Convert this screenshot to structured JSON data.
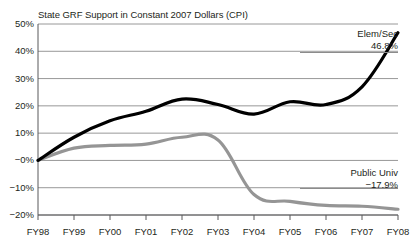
{
  "chart_data": {
    "type": "line",
    "title": "State GRF Support in Constant 2007 Dollars (CPI)",
    "xlabel": "",
    "ylabel": "",
    "grid": true,
    "legend_position": "inline-annotation",
    "x": [
      "FY98",
      "FY99",
      "FY00",
      "FY01",
      "FY02",
      "FY03",
      "FY04",
      "FY05",
      "FY06",
      "FY07",
      "FY08"
    ],
    "ylim": [
      -20,
      50
    ],
    "yticks": [
      -20,
      -10,
      0,
      10,
      20,
      30,
      40,
      50
    ],
    "ytick_labels": [
      "−20%",
      "−10%",
      "−0%",
      "10%",
      "20%",
      "30%",
      "40%",
      "50%"
    ],
    "series": [
      {
        "name": "Elem/Sec",
        "color": "#000000",
        "end_label": "46.8%",
        "end_value": 46.8,
        "values": [
          0.0,
          8.5,
          14.5,
          18.0,
          22.5,
          20.5,
          17.0,
          21.5,
          20.5,
          27.0,
          46.8
        ]
      },
      {
        "name": "Public Univ",
        "color": "#959595",
        "end_label": "−17.9%",
        "end_value": -17.9,
        "values": [
          0.0,
          4.5,
          5.5,
          6.0,
          8.5,
          7.5,
          -12.5,
          -15.0,
          -16.5,
          -16.8,
          -17.9
        ]
      }
    ]
  },
  "annotations": {
    "elem_sec": {
      "name": "Elem/Sec",
      "value": "46.8%"
    },
    "public_univ": {
      "name": "Public Univ",
      "value": "−17.9%"
    }
  },
  "colors": {
    "elem_sec": "#000000",
    "public_univ": "#959595",
    "grid": "#8c8c8c",
    "axis": "#58595b",
    "text": "#231f20",
    "background": "#ffffff"
  }
}
